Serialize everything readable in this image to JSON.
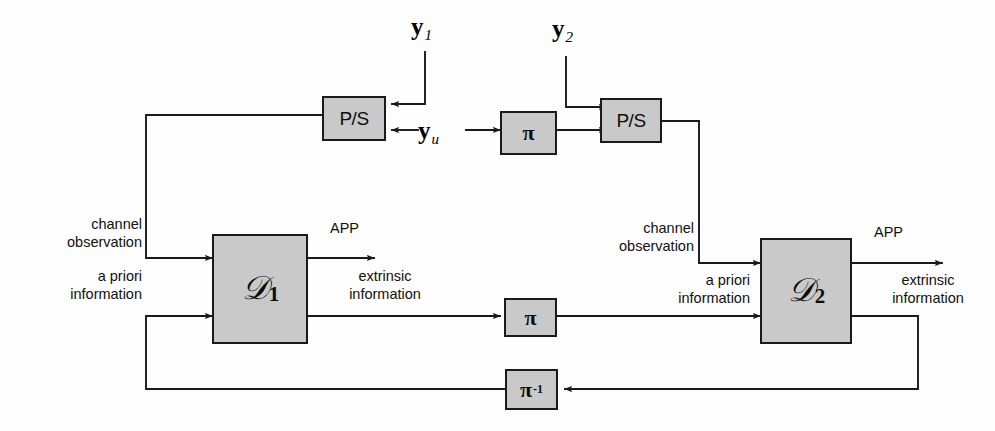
{
  "diagram": {
    "colors": {
      "box_fill": "#c9c9c9",
      "box_stroke": "#1a1a1a",
      "wire": "#1a1a1a",
      "background": "#fdfdfd",
      "text": "#111111"
    },
    "boxes": {
      "ps_left": {
        "label": "P/S"
      },
      "ps_right": {
        "label": "P/S"
      },
      "pi_top": {
        "label": "π"
      },
      "pi_bottom": {
        "label": "π"
      },
      "pi_inverse": {
        "label": "π",
        "exponent": "-1"
      },
      "decoder_1": {
        "label": "𝒟",
        "subscript": "1"
      },
      "decoder_2": {
        "label": "𝒟",
        "subscript": "2"
      }
    },
    "signals": {
      "y1": {
        "symbol": "y",
        "subscript": "1"
      },
      "y2": {
        "symbol": "y",
        "subscript": "2"
      },
      "yu": {
        "symbol": "y",
        "subscript": "u"
      }
    },
    "labels": {
      "channel_observation_left_line1": "channel",
      "channel_observation_left_line2": "observation",
      "a_priori_left_line1": "a priori",
      "a_priori_left_line2": "information",
      "app_left": "APP",
      "extrinsic_left_line1": "extrinsic",
      "extrinsic_left_line2": "information",
      "channel_observation_right_line1": "channel",
      "channel_observation_right_line2": "observation",
      "a_priori_right_line1": "a priori",
      "a_priori_right_line2": "information",
      "app_right": "APP",
      "extrinsic_right_line1": "extrinsic",
      "extrinsic_right_line2": "information"
    }
  }
}
